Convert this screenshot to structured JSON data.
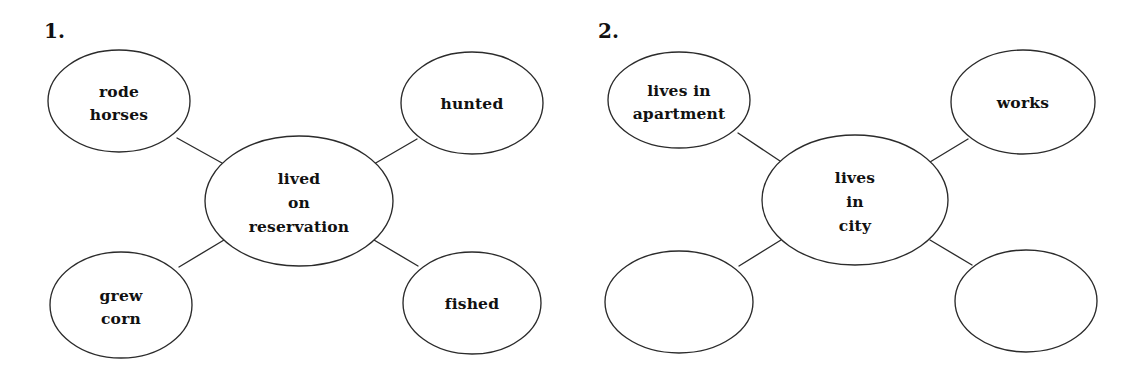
{
  "page": {
    "background_color": "#ffffff",
    "ink_color": "#2b2b2b",
    "text_color": "#111111"
  },
  "diagrams": [
    {
      "number_label": "1.",
      "center": {
        "label_lines": [
          "lived",
          "on",
          "reservation"
        ],
        "cx": 299,
        "cy": 201,
        "rx": 94,
        "ry": 65
      },
      "nodes": [
        {
          "position": "top-left",
          "label_lines": [
            "rode",
            "horses"
          ],
          "cx": 119,
          "cy": 101,
          "rx": 71,
          "ry": 51,
          "empty": false
        },
        {
          "position": "top-right",
          "label_lines": [
            "hunted"
          ],
          "cx": 472,
          "cy": 103,
          "rx": 71,
          "ry": 51,
          "empty": false
        },
        {
          "position": "bottom-left",
          "label_lines": [
            "grew",
            "corn"
          ],
          "cx": 121,
          "cy": 305,
          "rx": 71,
          "ry": 53,
          "empty": false
        },
        {
          "position": "bottom-right",
          "label_lines": [
            "fished"
          ],
          "cx": 472,
          "cy": 303,
          "rx": 69,
          "ry": 51,
          "empty": false
        }
      ],
      "connectors": [
        {
          "from": "top-left",
          "x1": 177,
          "y1": 138,
          "x2": 222,
          "y2": 163
        },
        {
          "from": "top-right",
          "x1": 417,
          "y1": 139,
          "x2": 374,
          "y2": 164
        },
        {
          "from": "bottom-left",
          "x1": 179,
          "y1": 267,
          "x2": 224,
          "y2": 240
        },
        {
          "from": "bottom-right",
          "x1": 418,
          "y1": 266,
          "x2": 374,
          "y2": 240
        }
      ]
    },
    {
      "number_label": "2.",
      "center": {
        "label_lines": [
          "lives",
          "in",
          "city"
        ],
        "cx": 855,
        "cy": 200,
        "rx": 93,
        "ry": 65
      },
      "nodes": [
        {
          "position": "top-left",
          "label_lines": [
            "lives in",
            "apartment"
          ],
          "cx": 679,
          "cy": 100,
          "rx": 71,
          "ry": 48,
          "empty": false
        },
        {
          "position": "top-right",
          "label_lines": [
            "works"
          ],
          "cx": 1023,
          "cy": 102,
          "rx": 72,
          "ry": 52,
          "empty": false
        },
        {
          "position": "bottom-left",
          "label_lines": [],
          "cx": 679,
          "cy": 302,
          "rx": 74,
          "ry": 51,
          "empty": true
        },
        {
          "position": "bottom-right",
          "label_lines": [],
          "cx": 1026,
          "cy": 301,
          "rx": 71,
          "ry": 51,
          "empty": true
        }
      ],
      "connectors": [
        {
          "from": "top-left",
          "x1": 738,
          "y1": 133,
          "x2": 780,
          "y2": 161
        },
        {
          "from": "top-right",
          "x1": 968,
          "y1": 139,
          "x2": 930,
          "y2": 162
        },
        {
          "from": "bottom-left",
          "x1": 739,
          "y1": 266,
          "x2": 781,
          "y2": 240
        },
        {
          "from": "bottom-right",
          "x1": 972,
          "y1": 265,
          "x2": 930,
          "y2": 240
        }
      ]
    }
  ],
  "numbers": {
    "first": "1.",
    "second": "2."
  },
  "number_positions": [
    {
      "x": 44,
      "y": 38
    },
    {
      "x": 598,
      "y": 38
    }
  ]
}
